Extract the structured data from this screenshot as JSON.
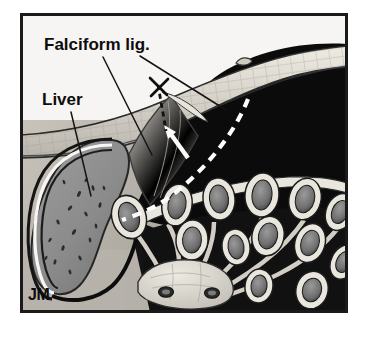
{
  "figure": {
    "title": "Falciform lig.",
    "kind": "anatomical-illustration",
    "artist_signature": "JM",
    "frame": {
      "x": 20,
      "y": 13,
      "width": 328,
      "height": 300,
      "border_color": "#1a1a1a",
      "border_width": 3,
      "background_color": "#f4f3f1"
    }
  },
  "labels": [
    {
      "id": "falciform",
      "text": "Falciform lig.",
      "x": 44,
      "y": 50,
      "font_size": 17,
      "color": "#0d0d0d"
    },
    {
      "id": "liver",
      "text": "Liver",
      "x": 42,
      "y": 105,
      "font_size": 17,
      "color": "#0d0d0d"
    }
  ],
  "signature": {
    "text": "JM",
    "x": 28,
    "y": 300,
    "font_size": 16,
    "color": "#141414"
  },
  "leader_lines": [
    {
      "id": "falciform-leader-left",
      "x1": 103,
      "y1": 57,
      "x2": 152,
      "y2": 155
    },
    {
      "id": "falciform-leader-right",
      "x1": 140,
      "y1": 56,
      "x2": 226,
      "y2": 110
    },
    {
      "id": "liver-leader",
      "x1": 71,
      "y1": 112,
      "x2": 91,
      "y2": 196
    }
  ],
  "annotations": {
    "incision_dashes": {
      "id": "black-dashed-incision",
      "color": "#111111",
      "dash": "5 4",
      "width": 2.6,
      "path": "M 158 85 L 163 113 L 166 131"
    },
    "cross_marks": [
      {
        "id": "suture-cross-upper",
        "x1": 150,
        "y1": 78,
        "x2": 166,
        "y2": 94
      },
      {
        "id": "suture-cross-lower",
        "x1": 167,
        "y1": 79,
        "x2": 151,
        "y2": 95
      }
    ],
    "reflection_dashes": {
      "id": "white-dashed-peritoneal-reflection",
      "color": "#fdfdfd",
      "dash": "9 7",
      "width": 4.2,
      "path": "M 248 99 C 236 130, 210 165, 175 193 C 160 205, 143 213, 122 220"
    },
    "arrow": {
      "id": "white-direction-arrow",
      "color": "#fdfdfd",
      "tail_x": 188,
      "tail_y": 158,
      "tip_x": 166,
      "tip_y": 127
    }
  },
  "regions": {
    "cavity": {
      "name": "peritoneal-cavity",
      "color": "#0b0b0b"
    },
    "abdominal_wall": {
      "name": "abdominal-wall",
      "color": "#d9d5cd"
    },
    "liver": {
      "name": "liver",
      "color": "#8d8d8d"
    },
    "falciform_ligament": {
      "name": "falciform-ligament",
      "color": "#e4e1d9"
    },
    "mesentery": {
      "name": "mesentery",
      "color": "#141414"
    },
    "bowel_wall": {
      "name": "bowel-wall",
      "color": "#e8e5dd"
    },
    "bowel_lumen": {
      "name": "bowel-lumen",
      "color": "#7e7e7e"
    },
    "retroperitoneal_mass": {
      "name": "retroperitoneal-structure",
      "color": "#dcd8cf"
    },
    "soft_tissue": {
      "name": "soft-tissue-background",
      "color": "#b4b0a8"
    }
  },
  "bowel_loops": [
    {
      "cx": 129,
      "cy": 217,
      "rx": 17,
      "ry": 22,
      "rot": -18
    },
    {
      "cx": 177,
      "cy": 205,
      "rx": 15,
      "ry": 21,
      "rot": 10
    },
    {
      "cx": 219,
      "cy": 199,
      "rx": 16,
      "ry": 21,
      "rot": -6
    },
    {
      "cx": 262,
      "cy": 195,
      "rx": 17,
      "ry": 22,
      "rot": 6
    },
    {
      "cx": 305,
      "cy": 199,
      "rx": 16,
      "ry": 21,
      "rot": 14
    },
    {
      "cx": 337,
      "cy": 210,
      "rx": 14,
      "ry": 19,
      "rot": 22
    },
    {
      "cx": 192,
      "cy": 240,
      "rx": 16,
      "ry": 20,
      "rot": 4
    },
    {
      "cx": 236,
      "cy": 247,
      "rx": 14,
      "ry": 18,
      "rot": -8
    },
    {
      "cx": 268,
      "cy": 236,
      "rx": 16,
      "ry": 20,
      "rot": 12
    },
    {
      "cx": 310,
      "cy": 243,
      "rx": 15,
      "ry": 20,
      "rot": 18
    },
    {
      "cx": 342,
      "cy": 260,
      "rx": 13,
      "ry": 18,
      "rot": 26
    },
    {
      "cx": 259,
      "cy": 286,
      "rx": 14,
      "ry": 17,
      "rot": 8
    },
    {
      "cx": 310,
      "cy": 288,
      "rx": 16,
      "ry": 19,
      "rot": 16
    }
  ],
  "retroperitoneal_vessels": [
    {
      "cx": 166,
      "cy": 292,
      "rx": 7,
      "ry": 5
    },
    {
      "cx": 212,
      "cy": 293,
      "rx": 7,
      "ry": 5
    }
  ]
}
